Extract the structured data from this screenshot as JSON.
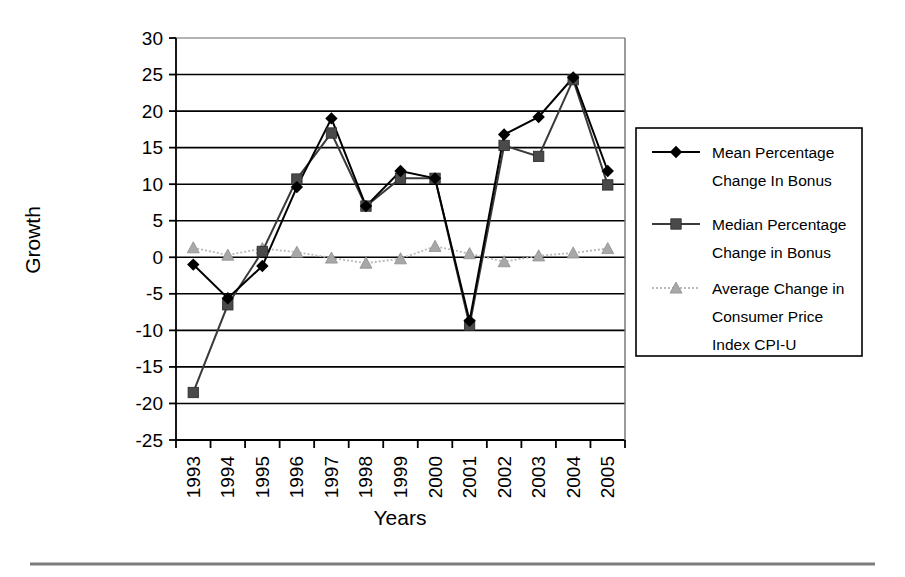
{
  "chart_data": {
    "type": "line",
    "title": "",
    "xlabel": "Years",
    "ylabel": "Growth",
    "categories": [
      "1993",
      "1994",
      "1995",
      "1996",
      "1997",
      "1998",
      "1999",
      "2000",
      "2001",
      "2002",
      "2003",
      "2004",
      "2005"
    ],
    "ylim": [
      -25,
      30
    ],
    "ytick_step": 5,
    "yticks": [
      "30",
      "25",
      "20",
      "15",
      "10",
      "5",
      "0",
      "-5",
      "-10",
      "-15",
      "-20",
      "-25"
    ],
    "grid": "horizontal",
    "legend_position": "right",
    "series": [
      {
        "name": "Mean Percentage Change In Bonus",
        "marker": "diamond",
        "color": "#000000",
        "values": [
          -1.0,
          -5.6,
          -1.2,
          9.6,
          19.0,
          7.0,
          11.8,
          10.8,
          -8.7,
          16.8,
          19.2,
          24.6,
          11.8
        ]
      },
      {
        "name": "Median Percentage Change in Bonus",
        "marker": "square",
        "color": "#4a4a4a",
        "values": [
          -18.5,
          -6.5,
          0.8,
          10.7,
          17.0,
          7.0,
          10.8,
          10.8,
          -9.3,
          15.3,
          13.8,
          24.3,
          9.9
        ]
      },
      {
        "name": "Average Change in Consumer Price Index CPI-U",
        "marker": "triangle",
        "color": "#a8a8a8",
        "values": [
          1.3,
          0.3,
          1.2,
          0.7,
          -0.1,
          -0.8,
          -0.2,
          1.5,
          0.5,
          -0.6,
          0.2,
          0.6,
          1.2
        ]
      }
    ]
  },
  "axes": {
    "y_title": "Growth",
    "x_title": "Years"
  },
  "legend": {
    "entries": [
      {
        "label_line1": "Mean Percentage",
        "label_line2": "Change In Bonus",
        "marker": "diamond-marker-icon"
      },
      {
        "label_line1": "Median Percentage",
        "label_line2": "Change in Bonus",
        "marker": "square-marker-icon"
      },
      {
        "label_line1": "Average Change in",
        "label_line2": "Consumer Price",
        "label_line3": "Index CPI-U",
        "marker": "triangle-marker-icon"
      }
    ]
  }
}
